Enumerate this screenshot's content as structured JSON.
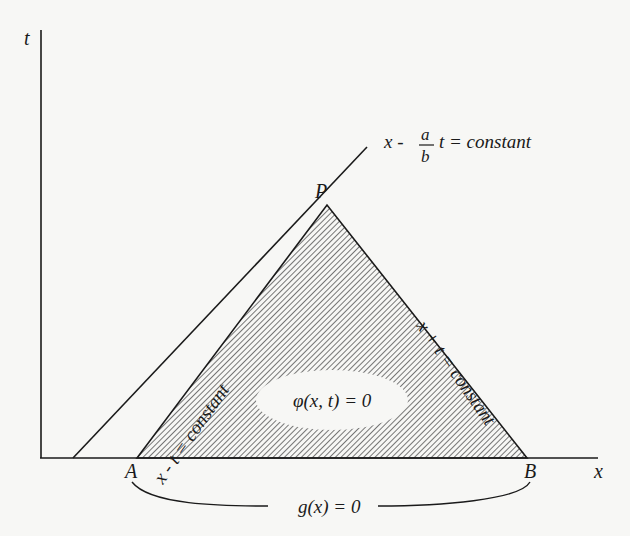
{
  "diagram": {
    "axes": {
      "x_label": "x",
      "t_label": "t"
    },
    "points": {
      "P": "P",
      "A": "A",
      "B": "B"
    },
    "lines": {
      "characteristic_outer": {
        "lhs": "x -",
        "frac_num": "a",
        "frac_den": "b",
        "rhs": "t = constant"
      },
      "left_edge": "x - t = constant",
      "right_edge": "x + t = constant"
    },
    "region_label": "φ(x, t) = 0",
    "base_label": "g(x) = 0",
    "colors": {
      "ink": "#1a1a1a",
      "background": "#f7f7f5",
      "hatch": "#555555"
    }
  }
}
